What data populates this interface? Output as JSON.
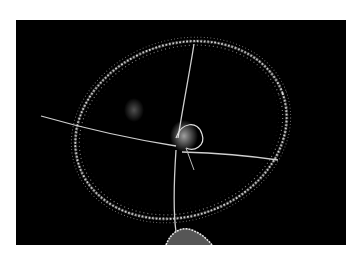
{
  "image": {
    "subject": "Jellyfish (hydromedusa) photographed against a black background",
    "caption": "Translucent jellyfish bell with four radial canals and fringed tentacle margin",
    "colors": {
      "frame": "#ffffff",
      "background": "#000000",
      "subject": "#e8e8e8"
    }
  }
}
